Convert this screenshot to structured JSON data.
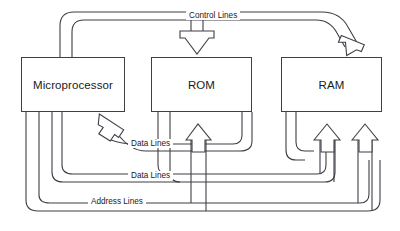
{
  "diagram": {
    "stroke_color": "#3f3f46",
    "background_color": "#ffffff",
    "units": [
      {
        "id": "microprocessor",
        "label": "Microprocessor",
        "x": 21,
        "y": 57,
        "width": 104,
        "height": 55
      },
      {
        "id": "rom",
        "label": "ROM",
        "x": 151,
        "y": 57,
        "width": 101,
        "height": 55
      },
      {
        "id": "ram",
        "label": "RAM",
        "x": 281,
        "y": 57,
        "width": 101,
        "height": 55
      }
    ],
    "buses": [
      {
        "id": "control-lines",
        "label": "Control Lines",
        "label_x": 186,
        "label_y": 11,
        "direction": "microprocessor-to-rom-and-ram"
      },
      {
        "id": "data-lines-in",
        "label": "Data Lines",
        "label_x": 128,
        "label_y": 139,
        "direction": "memory-to-microprocessor"
      },
      {
        "id": "data-lines-out",
        "label": "Data Lines",
        "label_x": 128,
        "label_y": 171,
        "direction": "microprocessor-to-memory"
      },
      {
        "id": "address-lines",
        "label": "Address Lines",
        "label_x": 88,
        "label_y": 197,
        "direction": "microprocessor-to-memory"
      }
    ]
  }
}
